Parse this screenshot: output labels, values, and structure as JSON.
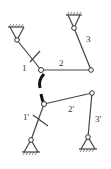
{
  "diagram": {
    "type": "two-linkage mechanism with coupling",
    "labels": {
      "link1": "1",
      "link2": "2",
      "link3": "3",
      "link1p": "1'",
      "link2p": "2'",
      "link3p": "3'"
    },
    "colors": {
      "line": "#444444",
      "coupling": "#111111"
    }
  }
}
